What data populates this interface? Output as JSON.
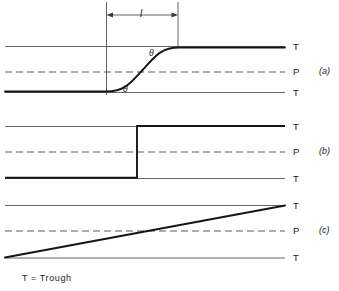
{
  "figure": {
    "background_color": "#ffffff",
    "line_color": "#1a1a1a",
    "width": 339,
    "height": 291
  },
  "dimension": {
    "label": "l",
    "name": "length-dimension"
  },
  "angles": {
    "upper": "θ",
    "lower": "θ"
  },
  "panels": [
    {
      "id": "a",
      "label": "(a)",
      "profile": "s-curve",
      "lines": [
        {
          "type": "trough",
          "label": "T",
          "position": "top"
        },
        {
          "type": "pool",
          "label": "P",
          "position": "middle"
        },
        {
          "type": "trough",
          "label": "T",
          "position": "bottom"
        }
      ]
    },
    {
      "id": "b",
      "label": "(b)",
      "profile": "step",
      "lines": [
        {
          "type": "trough",
          "label": "T",
          "position": "top"
        },
        {
          "type": "pool",
          "label": "P",
          "position": "middle"
        },
        {
          "type": "trough",
          "label": "T",
          "position": "bottom"
        }
      ]
    },
    {
      "id": "c",
      "label": "(c)",
      "profile": "linear-ramp",
      "lines": [
        {
          "type": "trough",
          "label": "T",
          "position": "top"
        },
        {
          "type": "pool",
          "label": "P",
          "position": "middle"
        },
        {
          "type": "trough",
          "label": "T",
          "position": "bottom"
        }
      ]
    }
  ],
  "caption": {
    "text": "T = Trough"
  }
}
